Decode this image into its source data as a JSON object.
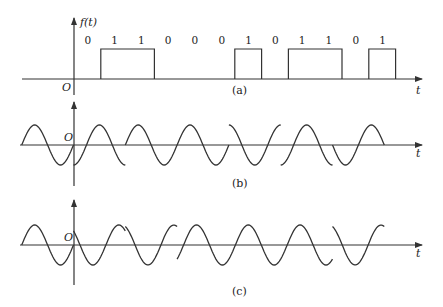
{
  "figure": {
    "panels": {
      "a": {
        "caption": "(a)",
        "y_label": "f(t)",
        "origin_label": "O",
        "t_label": "t",
        "bits": [
          "0",
          "1",
          "1",
          "0",
          "0",
          "0",
          "1",
          "0",
          "1",
          "1",
          "0",
          "1"
        ],
        "bit_values": [
          0,
          1,
          1,
          0,
          0,
          0,
          1,
          0,
          1,
          1,
          0,
          1
        ]
      },
      "b": {
        "caption": "(b)",
        "origin_label": "O",
        "t_label": "t",
        "segments_phase_rad": [
          0,
          -1.5708,
          0,
          0,
          1.5708,
          -1.5708,
          3.1416
        ]
      },
      "c": {
        "caption": "(c)",
        "origin_label": "O",
        "t_label": "t",
        "segments_phase_rad": [
          0,
          2.3562,
          1.9635,
          -0.7854,
          -0.7854,
          -0.7854,
          1.9635
        ]
      }
    },
    "colors": {
      "ink": "#333333",
      "background": "#ffffff"
    }
  },
  "chart_data": {
    "type": "line",
    "panels": [
      {
        "id": "a",
        "kind": "binary baseband",
        "bits": [
          0,
          1,
          1,
          0,
          0,
          0,
          1,
          0,
          1,
          1,
          0,
          1
        ],
        "xlabel": "t",
        "ylabel": "f(t)"
      },
      {
        "id": "b",
        "kind": "carrier segments, one cycle per dibit",
        "phases_deg": [
          0,
          -90,
          0,
          0,
          90,
          -90,
          180
        ],
        "xlabel": "t"
      },
      {
        "id": "c",
        "kind": "carrier segments, one cycle per dibit",
        "phases_deg": [
          0,
          135,
          112.5,
          -45,
          -45,
          -45,
          112.5
        ],
        "xlabel": "t"
      }
    ]
  }
}
